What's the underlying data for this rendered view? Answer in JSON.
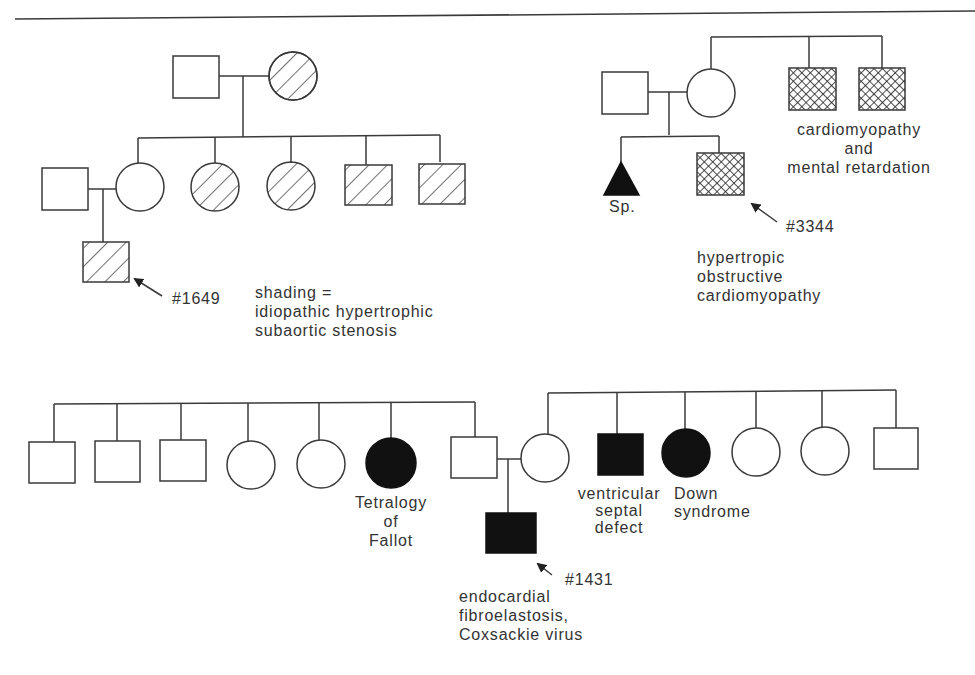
{
  "pedigree_1": {
    "proband_id": "#1649",
    "legend_line1": "shading =",
    "legend_line2": "idiopathic hypertrophic",
    "legend_line3": "subaortic stenosis"
  },
  "pedigree_2": {
    "sp_label": "Sp.",
    "proband_id": "#3344",
    "proband_dx_line1": "hypertropic",
    "proband_dx_line2": "obstructive",
    "proband_dx_line3": "cardiomyopathy",
    "uncles_dx_line1": "cardiomyopathy",
    "uncles_dx_line2": "and",
    "uncles_dx_line3": "mental retardation"
  },
  "pedigree_3": {
    "aunt_dx_line1": "Tetralogy",
    "aunt_dx_line2": "of",
    "aunt_dx_line3": "Fallot",
    "uncle_dx_line1": "ventricular",
    "uncle_dx_line2": "septal",
    "uncle_dx_line3": "defect",
    "aunt2_dx_line1": "Down",
    "aunt2_dx_line2": "syndrome",
    "proband_id": "#1431",
    "proband_dx_line1": "endocardial",
    "proband_dx_line2": "fibroelastosis,",
    "proband_dx_line3": "Coxsackie virus"
  },
  "colors": {
    "line": "#3a3a3a",
    "affected_fill": "#111111"
  }
}
